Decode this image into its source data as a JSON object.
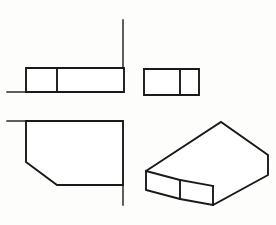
{
  "sheet": {
    "title": "Orthographic Projection Drawing",
    "width": 276,
    "height": 225,
    "background_color": "#fdfdfc",
    "line_color": "#1a1a1a",
    "face_color": "#ffffff",
    "line_width_main": 1.9,
    "line_width_thin": 1.4,
    "projection_type": "third-angle-style multiview with pictorial",
    "view_count": 4
  },
  "views": [
    {
      "id": "front-view",
      "name": "Front Elevation",
      "description": "Rectangle divided by one vertical line, with left extension line at its base",
      "outline": [
        [
          26,
          68
        ],
        [
          124,
          68
        ],
        [
          124,
          92
        ],
        [
          26,
          92
        ]
      ],
      "internal_lines": [
        {
          "name": "vertical-divider",
          "points": [
            [
              57,
              68
            ],
            [
              57,
              92
            ]
          ]
        }
      ],
      "extension_lines": [
        {
          "name": "base-extension-left",
          "points": [
            [
              7,
              92
            ],
            [
              26,
              92
            ]
          ]
        }
      ]
    },
    {
      "id": "side-view",
      "name": "Side Elevation",
      "description": "Rectangle divided by one vertical line near its right side",
      "outline": [
        [
          144,
          69
        ],
        [
          199,
          69
        ],
        [
          199,
          95
        ],
        [
          144,
          95
        ]
      ],
      "internal_lines": [
        {
          "name": "vertical-divider",
          "points": [
            [
              180,
              69
            ],
            [
              180,
              95
            ]
          ]
        }
      ],
      "extension_lines": []
    },
    {
      "id": "top-view",
      "name": "Plan View",
      "description": "Rectangle with chamfered lower-left corner",
      "outline": [
        [
          26,
          121
        ],
        [
          123,
          121
        ],
        [
          123,
          185
        ],
        [
          57,
          185
        ],
        [
          26,
          162
        ]
      ],
      "internal_lines": [],
      "extension_lines": [
        {
          "name": "top-extension-left",
          "points": [
            [
              7,
              121
            ],
            [
              26,
              121
            ]
          ]
        },
        {
          "name": "right-extension-down",
          "points": [
            [
              123,
              185
            ],
            [
              123,
              205
            ]
          ]
        }
      ]
    },
    {
      "id": "pictorial-view",
      "name": "Isometric Pictorial",
      "description": "Rectangular block with a chamfer cut on the near-left lower corner",
      "faces": [
        {
          "name": "top-face",
          "polygon": [
            [
              146,
              171
            ],
            [
              221,
              122
            ],
            [
              268,
              155
            ],
            [
              213,
              186
            ],
            [
              180,
              180
            ]
          ]
        },
        {
          "name": "chamfer-face",
          "polygon": [
            [
              180,
              180
            ],
            [
              213,
              186
            ],
            [
              213,
              205
            ],
            [
              180,
              199
            ]
          ]
        },
        {
          "name": "left-face",
          "polygon": [
            [
              146,
              171
            ],
            [
              180,
              180
            ],
            [
              180,
              199
            ],
            [
              146,
              190
            ]
          ]
        },
        {
          "name": "right-face",
          "polygon": [
            [
              213,
              186
            ],
            [
              268,
              155
            ],
            [
              268,
              175
            ],
            [
              213,
              205
            ]
          ]
        }
      ],
      "silhouette": [
        [
          146,
          171
        ],
        [
          221,
          122
        ],
        [
          268,
          155
        ],
        [
          268,
          175
        ],
        [
          213,
          205
        ],
        [
          180,
          199
        ],
        [
          146,
          190
        ]
      ],
      "internal_lines": [
        {
          "name": "top-to-chamfer-edge",
          "points": [
            [
              180,
              180
            ],
            [
              213,
              186
            ]
          ]
        },
        {
          "name": "left-face-vertical-edge",
          "points": [
            [
              180,
              180
            ],
            [
              180,
              199
            ]
          ]
        },
        {
          "name": "right-face-vertical-edge",
          "points": [
            [
              213,
              186
            ],
            [
              213,
              205
            ]
          ]
        },
        {
          "name": "top-face-near-left-edge",
          "points": [
            [
              146,
              171
            ],
            [
              180,
              180
            ]
          ]
        }
      ]
    }
  ]
}
